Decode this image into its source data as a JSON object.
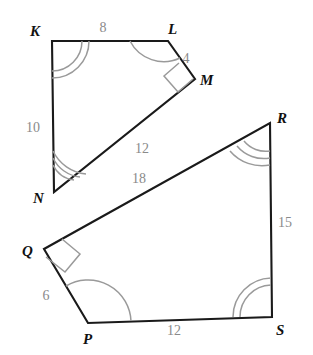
{
  "figure": {
    "background_color": "#ffffff",
    "edge_color": "#1a1a1a",
    "label_color": "#111111",
    "measure_color": "#8a8a8a",
    "arc_color": "#9a9a9a",
    "shapes": [
      {
        "name": "quadrilateral-klmn",
        "vertices": [
          "K",
          "L",
          "M",
          "N"
        ],
        "points": "52,41 168,41 195,79 54,192",
        "sides": [
          {
            "from": "K",
            "to": "L",
            "length": "8"
          },
          {
            "from": "L",
            "to": "M",
            "length": "4"
          },
          {
            "from": "M",
            "to": "N",
            "length": "12"
          },
          {
            "from": "N",
            "to": "K",
            "length": "10"
          }
        ],
        "angles": [
          {
            "vertex": "K",
            "mark": "double-arc"
          },
          {
            "vertex": "L",
            "mark": "single-arc"
          },
          {
            "vertex": "M",
            "mark": "right-angle"
          },
          {
            "vertex": "N",
            "mark": "triple-arc"
          }
        ]
      },
      {
        "name": "quadrilateral-qpsr",
        "vertices": [
          "Q",
          "P",
          "S",
          "R"
        ],
        "points": "44,249 88,323 272,317 270,123",
        "sides": [
          {
            "from": "Q",
            "to": "P",
            "length": "6"
          },
          {
            "from": "P",
            "to": "S",
            "length": "12"
          },
          {
            "from": "S",
            "to": "R",
            "length": "15"
          },
          {
            "from": "R",
            "to": "Q",
            "length": "18"
          }
        ],
        "angles": [
          {
            "vertex": "Q",
            "mark": "right-angle"
          },
          {
            "vertex": "P",
            "mark": "single-arc"
          },
          {
            "vertex": "S",
            "mark": "double-arc"
          },
          {
            "vertex": "R",
            "mark": "triple-arc"
          }
        ]
      }
    ],
    "vertex_labels": {
      "K": "K",
      "L": "L",
      "M": "M",
      "N": "N",
      "P": "P",
      "Q": "Q",
      "R": "R",
      "S": "S"
    },
    "side_measures": {
      "kl": "8",
      "lm": "4",
      "mn": "12",
      "nk": "10",
      "qp": "6",
      "ps": "12",
      "sr": "15",
      "rq": "18"
    }
  }
}
